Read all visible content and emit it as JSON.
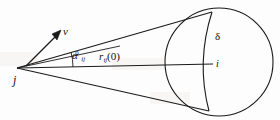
{
  "figure": {
    "background_color": "#fdfdfd",
    "line_color": "#1a1a1a",
    "labels": {
      "apex": "j",
      "velocity": "v",
      "angle_base": "α",
      "angle_sub": "ij",
      "angle_sup": "0",
      "radius_base": "r",
      "radius_sub": "ij",
      "radius_arg": "(0)",
      "delta": "δ",
      "target": "i"
    },
    "geometry": {
      "apex": {
        "x": 17,
        "y": 68
      },
      "circle": {
        "cx": 219,
        "cy": 62,
        "r": 54
      },
      "axis_line": {
        "x1": 17,
        "y1": 68,
        "x2": 213,
        "y2": 64
      },
      "upper_tangent": {
        "x1": 17,
        "y1": 68,
        "x2": 212,
        "y2": 12
      },
      "lower_tangent": {
        "x1": 17,
        "y1": 68,
        "x2": 209,
        "y2": 111
      },
      "velocity_arrow": {
        "x1": 26,
        "y1": 66,
        "x2": 60,
        "y2": 32
      },
      "angle_arc": {
        "cx": 17,
        "cy": 68,
        "r": 56,
        "start_deg": -16,
        "end_deg": 0
      },
      "terminator_arc": {
        "start": {
          "x": 212,
          "y": 12
        },
        "control": {
          "x": 196,
          "y": 62
        },
        "end": {
          "x": 209,
          "y": 111
        }
      }
    }
  }
}
